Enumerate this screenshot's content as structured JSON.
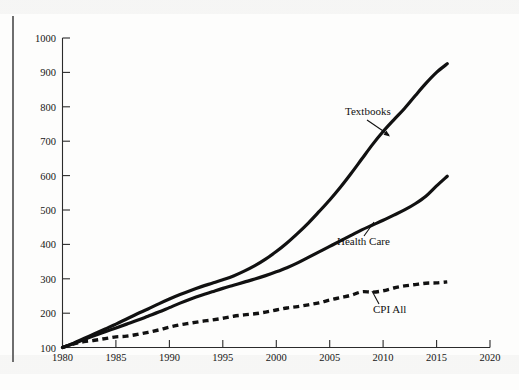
{
  "figure": {
    "background_color": "#fdfdfc",
    "ink_color": "#111111",
    "axis_color": "#2b2b2b",
    "edge_rule_color": "#6e6e6e"
  },
  "chart_data": {
    "type": "line",
    "title": "",
    "subtitle": "",
    "xlabel": "",
    "ylabel": "",
    "xlim": [
      1980,
      2020
    ],
    "ylim": [
      100,
      1000
    ],
    "grid": false,
    "legend_position": "inline-annotations",
    "x_ticks": [
      "1980",
      "1985",
      "1990",
      "1995",
      "2000",
      "2005",
      "2010",
      "2015",
      "2020"
    ],
    "y_ticks": [
      "100",
      "200",
      "300",
      "400",
      "500",
      "600",
      "700",
      "800",
      "900",
      "1000"
    ],
    "x": [
      1980,
      1981,
      1982,
      1983,
      1984,
      1985,
      1986,
      1987,
      1988,
      1989,
      1990,
      1991,
      1992,
      1993,
      1994,
      1995,
      1996,
      1997,
      1998,
      1999,
      2000,
      2001,
      2002,
      2003,
      2004,
      2005,
      2006,
      2007,
      2008,
      2009,
      2010,
      2011,
      2012,
      2013,
      2014,
      2015,
      2016
    ],
    "series": [
      {
        "name": "Textbooks",
        "style": "solid",
        "label": "Textbooks",
        "values": [
          100,
          112,
          126,
          140,
          154,
          168,
          183,
          198,
          212,
          227,
          241,
          254,
          266,
          277,
          287,
          297,
          308,
          322,
          338,
          357,
          379,
          404,
          432,
          462,
          495,
          529,
          566,
          606,
          648,
          690,
          728,
          762,
          795,
          832,
          868,
          900,
          925
        ]
      },
      {
        "name": "Health Care",
        "style": "solid",
        "label": "Health Care",
        "values": [
          100,
          111,
          123,
          135,
          146,
          157,
          168,
          179,
          191,
          203,
          216,
          229,
          241,
          252,
          262,
          272,
          281,
          290,
          299,
          309,
          320,
          332,
          346,
          362,
          378,
          394,
          410,
          426,
          442,
          456,
          470,
          485,
          500,
          518,
          540,
          570,
          598
        ]
      },
      {
        "name": "CPI All",
        "style": "dashed",
        "label": "CPI All",
        "values": [
          100,
          110,
          117,
          121,
          126,
          131,
          133,
          138,
          144,
          151,
          159,
          166,
          171,
          176,
          180,
          185,
          191,
          195,
          198,
          203,
          209,
          215,
          219,
          224,
          230,
          238,
          245,
          252,
          262,
          261,
          265,
          273,
          279,
          283,
          287,
          288,
          291
        ]
      }
    ],
    "annotations": [
      {
        "text": "Textbooks",
        "series": "Textbooks",
        "at_x": 2011,
        "at_y": 730
      },
      {
        "text": "Health Care",
        "series": "Health Care",
        "at_x": 2009,
        "at_y": 462
      },
      {
        "text": "CPI All",
        "series": "CPI All",
        "at_x": 2008,
        "at_y": 248
      }
    ]
  }
}
